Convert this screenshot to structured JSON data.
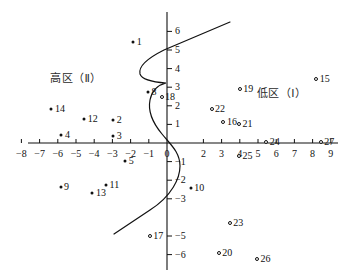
{
  "chart_data": {
    "type": "scatter",
    "title": "",
    "xlabel": "",
    "ylabel": "",
    "xlim": [
      -8.6,
      9.4
    ],
    "ylim": [
      -6.6,
      6.6
    ],
    "grid": false,
    "legend_position": "none",
    "x_ticks": [
      -8,
      -7,
      -6,
      -5,
      -4,
      -3,
      -2,
      -1,
      0,
      2,
      3,
      4,
      5,
      6,
      7,
      8,
      9
    ],
    "x_tick_labels": [
      "−8",
      "−7",
      "−6",
      "−5",
      "−4",
      "−3",
      "−2",
      "−1",
      "0",
      "2",
      "3",
      "4",
      "5",
      "6",
      "7",
      "8",
      "9"
    ],
    "y_ticks": [
      6,
      5,
      4,
      3,
      2,
      1,
      -1,
      -2,
      -3,
      -5,
      -6
    ],
    "y_tick_labels": [
      "6",
      "5",
      "4",
      "3",
      "2",
      "1",
      "−1",
      "−2",
      "−3",
      "−5",
      "−6"
    ],
    "annotations": [
      {
        "text": "高区（Ⅱ）",
        "x": -5.0,
        "y": 3.45,
        "name": "zone-label-high"
      },
      {
        "text": "低区（Ⅰ）",
        "x": 6.3,
        "y": 2.65,
        "name": "zone-label-low"
      }
    ],
    "series": [
      {
        "name": "高区样点",
        "marker": "filled",
        "points": [
          {
            "label": "1",
            "x": -1.85,
            "y": 5.45
          },
          {
            "label": "8",
            "x": -1.05,
            "y": 2.75
          },
          {
            "label": "14",
            "x": -6.35,
            "y": 1.85
          },
          {
            "label": "12",
            "x": -4.55,
            "y": 1.3
          },
          {
            "label": "2",
            "x": -2.95,
            "y": 1.25
          },
          {
            "label": "4",
            "x": -5.8,
            "y": 0.45
          },
          {
            "label": "3",
            "x": -2.95,
            "y": 0.38
          },
          {
            "label": "5",
            "x": -2.3,
            "y": -0.95
          },
          {
            "label": "9",
            "x": -5.85,
            "y": -2.35
          },
          {
            "label": "11",
            "x": -3.35,
            "y": -2.25
          },
          {
            "label": "13",
            "x": -4.1,
            "y": -2.7
          },
          {
            "label": "10",
            "x": 1.3,
            "y": -2.4
          }
        ]
      },
      {
        "name": "低区样点",
        "marker": "hollow",
        "points": [
          {
            "label": "15",
            "x": 8.2,
            "y": 3.45
          },
          {
            "label": "19",
            "x": 4.0,
            "y": 2.9
          },
          {
            "label": "18",
            "x": -0.3,
            "y": 2.5
          },
          {
            "label": "22",
            "x": 2.45,
            "y": 1.85
          },
          {
            "label": "16",
            "x": 3.1,
            "y": 1.15
          },
          {
            "label": "21",
            "x": 3.95,
            "y": 1.0
          },
          {
            "label": "24",
            "x": 5.45,
            "y": 0.05
          },
          {
            "label": "27",
            "x": 8.45,
            "y": 0.05
          },
          {
            "label": "25",
            "x": 3.95,
            "y": -0.7
          },
          {
            "label": "23",
            "x": 3.45,
            "y": -4.3
          },
          {
            "label": "17",
            "x": -0.95,
            "y": -5.0
          },
          {
            "label": "20",
            "x": 2.85,
            "y": -5.9
          },
          {
            "label": "26",
            "x": 4.95,
            "y": -6.25
          }
        ]
      }
    ],
    "curve": {
      "name": "分区曲线",
      "description": "S-shaped dividing curve separating the high zone and the low zone"
    }
  }
}
